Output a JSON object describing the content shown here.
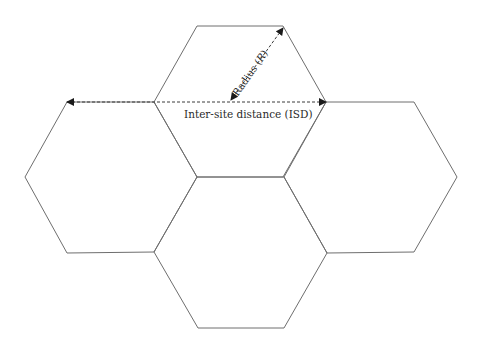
{
  "diagram": {
    "type": "hexagonal-cell-layout",
    "cells": [
      {
        "id": "top",
        "points": "197,26 283,26 326,102 283,177 197,177 154,102"
      },
      {
        "id": "left",
        "points": "67,102 154,102 197,177 154,252 67,253 25,177"
      },
      {
        "id": "right",
        "points": "326,102 414,102 457,177 414,252 327,253 284,177"
      },
      {
        "id": "bottom",
        "points": "197,177 284,177 327,253 284,328 198,328 154,252"
      }
    ],
    "labels": {
      "radius": "Radius (R)",
      "radius_prefix": "Radius (",
      "radius_var": "R",
      "radius_suffix": ")",
      "isd": "Inter-site distance (ISD)"
    },
    "arrows": {
      "isd": {
        "from": [
          67,
          102
        ],
        "to": [
          326,
          102
        ]
      },
      "radius": {
        "from": [
          231,
          100
        ],
        "to": [
          283,
          28
        ]
      }
    },
    "colors": {
      "cell_stroke": "#6e6e6e",
      "arrow": "#3a3a3a",
      "text": "#2a2a2a",
      "background": "#ffffff"
    }
  }
}
